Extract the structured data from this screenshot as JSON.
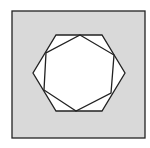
{
  "diagram": {
    "colors": {
      "background": "#ffffff",
      "square_fill": "#d9d9d9",
      "hexagon_fill": "#ffffff",
      "stroke": "#222222"
    },
    "square": {
      "x": 12,
      "y": 11,
      "width": 133,
      "height": 127
    },
    "outer_hexagon": {
      "points": [
        [
          56,
          35
        ],
        [
          102,
          35
        ],
        [
          125,
          73
        ],
        [
          102,
          111
        ],
        [
          56,
          111
        ],
        [
          33,
          73
        ]
      ]
    },
    "inner_hexagon": {
      "points": [
        [
          80,
          35
        ],
        [
          114,
          55
        ],
        [
          111,
          93
        ],
        [
          76,
          111
        ],
        [
          44,
          90
        ],
        [
          46,
          53
        ]
      ]
    }
  }
}
